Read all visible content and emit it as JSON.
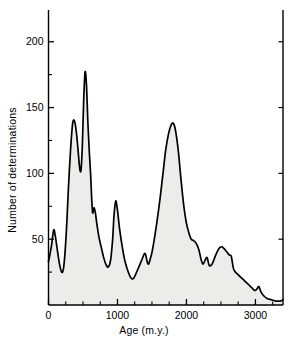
{
  "figure": {
    "background_color": "#ffffff",
    "curve_color": "#000000",
    "fill_color": "#ececeb"
  },
  "chart_data": {
    "type": "area",
    "title": "",
    "subtitle": "",
    "xlabel": "Age (m.y.)",
    "ylabel": "Number of determinations",
    "xlim": [
      0,
      3400
    ],
    "ylim": [
      0,
      215
    ],
    "grid": false,
    "legend": null,
    "x_major_ticks": [
      0,
      1000,
      2000,
      3000
    ],
    "x_major_tick_labels": [
      "0",
      "1000",
      "2000",
      "3000"
    ],
    "x_minor_tick_step": 250,
    "y_major_ticks": [
      50,
      100,
      150,
      200
    ],
    "y_major_tick_labels": [
      "50",
      "100",
      "150",
      "200"
    ],
    "y_minor_ticks": [
      25,
      75,
      125,
      175
    ],
    "series": [
      {
        "name": "Number of determinations",
        "x": [
          0,
          40,
          75,
          100,
          130,
          160,
          190,
          215,
          240,
          265,
          290,
          320,
          350,
          375,
          400,
          425,
          450,
          470,
          490,
          510,
          530,
          550,
          570,
          590,
          610,
          625,
          640,
          660,
          680,
          700,
          730,
          760,
          800,
          840,
          870,
          900,
          930,
          950,
          975,
          1000,
          1030,
          1070,
          1110,
          1150,
          1190,
          1230,
          1270,
          1310,
          1350,
          1390,
          1410,
          1430,
          1450,
          1470,
          1500,
          1540,
          1580,
          1620,
          1660,
          1700,
          1740,
          1780,
          1810,
          1840,
          1880,
          1920,
          1960,
          2000,
          2040,
          2070,
          2100,
          2140,
          2180,
          2210,
          2240,
          2270,
          2300,
          2330,
          2370,
          2410,
          2450,
          2490,
          2520,
          2560,
          2590,
          2620,
          2650,
          2680,
          2710,
          2750,
          2790,
          2830,
          2870,
          2910,
          2950,
          2990,
          3020,
          3050,
          3080,
          3120,
          3170,
          3230,
          3300,
          3360,
          3400
        ],
        "values": [
          33,
          44,
          57,
          52,
          41,
          31,
          25,
          27,
          40,
          62,
          90,
          118,
          138,
          140,
          133,
          120,
          105,
          102,
          120,
          155,
          177,
          168,
          140,
          118,
          100,
          82,
          70,
          74,
          70,
          62,
          52,
          45,
          36,
          30,
          29,
          34,
          50,
          68,
          79,
          72,
          58,
          44,
          33,
          26,
          21,
          20,
          24,
          29,
          34,
          39,
          38,
          33,
          31,
          34,
          40,
          52,
          66,
          82,
          100,
          118,
          130,
          137,
          138,
          133,
          118,
          96,
          76,
          62,
          54,
          50,
          49,
          47,
          42,
          35,
          31,
          34,
          36,
          30,
          31,
          36,
          41,
          44,
          44,
          42,
          40,
          38,
          37,
          28,
          25,
          23,
          21,
          19,
          17,
          15,
          13,
          11,
          12,
          14,
          10,
          7,
          5,
          4,
          3,
          3,
          4
        ]
      }
    ]
  },
  "caption": {
    "text": ""
  }
}
